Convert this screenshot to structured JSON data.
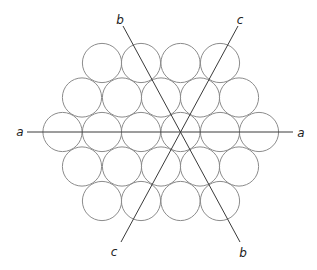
{
  "diagram": {
    "circle_radius": 19.6,
    "rows": [
      {
        "y": 63,
        "xs": [
          102,
          141,
          180.5,
          220
        ]
      },
      {
        "y": 97.5,
        "xs": [
          82,
          122,
          161,
          200,
          239
        ]
      },
      {
        "y": 132,
        "xs": [
          62.5,
          102,
          141,
          180.5,
          220,
          259
        ]
      },
      {
        "y": 166.5,
        "xs": [
          82,
          122,
          161,
          200,
          239
        ]
      },
      {
        "y": 201,
        "xs": [
          102,
          141,
          180.5,
          220
        ]
      }
    ],
    "axes": [
      {
        "name": "a",
        "x1": 27,
        "y1": 132,
        "x2": 293,
        "y2": 132
      },
      {
        "name": "b",
        "x1": 123,
        "y1": 26,
        "x2": 240,
        "y2": 242
      },
      {
        "name": "c",
        "x1": 238,
        "y1": 26,
        "x2": 121,
        "y2": 242
      }
    ],
    "labels": {
      "a_left": "a",
      "a_right": "a",
      "b_top": "b",
      "b_bottom": "b",
      "c_top": "c",
      "c_bottom": "c"
    },
    "colors": {
      "circle_stroke": "#8c8c8c",
      "axis_stroke": "#3a3a3a",
      "background": "#ffffff"
    }
  }
}
